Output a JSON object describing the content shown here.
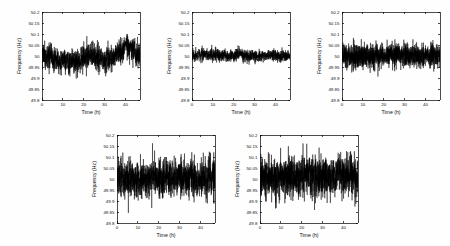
{
  "figure": {
    "background_color": "#ffffff",
    "line_color": "#000000",
    "panel_count": 5,
    "layout": "2 rows: 3 panels on top, 2 panels on bottom"
  },
  "chart_data": [
    {
      "type": "line",
      "panel_index": 1,
      "position": "top-left",
      "title": "",
      "xlabel": "Time (h)",
      "ylabel": "Frequency (Hz)",
      "xlim": [
        0,
        47
      ],
      "ylim": [
        49.8,
        50.2
      ],
      "xticks": [
        0,
        10,
        20,
        30,
        40
      ],
      "xticklabels": [
        "0",
        "10",
        "20",
        "30",
        "40"
      ],
      "yticks": [
        49.8,
        49.85,
        49.9,
        49.95,
        50,
        50.05,
        50.1,
        50.15,
        50.2
      ],
      "yticklabels": [
        "49.8",
        "49.85",
        "49.9",
        "49.95",
        "50",
        "50.05",
        "50.1",
        "50.15",
        "50.2"
      ],
      "grid": false,
      "legend": null,
      "series_name": "Grid frequency trace 1",
      "noise_sigma": 0.028,
      "noise_mean": 50.005,
      "slow_drift_amplitude": 0.022,
      "observed_min": 49.875,
      "observed_max": 50.115,
      "seed": 101,
      "n_points": 1400
    },
    {
      "type": "line",
      "panel_index": 2,
      "position": "top-center",
      "title": "",
      "xlabel": "Time (h)",
      "ylabel": "Frequency (Hz)",
      "xlim": [
        0,
        47
      ],
      "ylim": [
        49.8,
        50.2
      ],
      "xticks": [
        0,
        10,
        20,
        30,
        40
      ],
      "xticklabels": [
        "0",
        "10",
        "20",
        "30",
        "40"
      ],
      "yticks": [
        49.8,
        49.85,
        49.9,
        49.95,
        50,
        50.05,
        50.1,
        50.15,
        50.2
      ],
      "yticklabels": [
        "49.8",
        "49.85",
        "49.9",
        "49.95",
        "50",
        "50.05",
        "50.1",
        "50.15",
        "50.2"
      ],
      "grid": false,
      "legend": null,
      "series_name": "Grid frequency trace 2",
      "noise_sigma": 0.013,
      "noise_mean": 50.001,
      "slow_drift_amplitude": 0.006,
      "observed_min": 49.952,
      "observed_max": 50.062,
      "seed": 202,
      "n_points": 1400
    },
    {
      "type": "line",
      "panel_index": 3,
      "position": "top-right",
      "title": "",
      "xlabel": "Time (h)",
      "ylabel": "Frequency (Hz)",
      "xlim": [
        0,
        47
      ],
      "ylim": [
        49.8,
        50.2
      ],
      "xticks": [
        0,
        10,
        20,
        30,
        40
      ],
      "xticklabels": [
        "0",
        "10",
        "20",
        "30",
        "40"
      ],
      "yticks": [
        49.8,
        49.85,
        49.9,
        49.95,
        50,
        50.05,
        50.1,
        50.15,
        50.2
      ],
      "yticklabels": [
        "49.8",
        "49.85",
        "49.9",
        "49.95",
        "50",
        "50.05",
        "50.1",
        "50.15",
        "50.2"
      ],
      "grid": false,
      "legend": null,
      "series_name": "Grid frequency trace 3",
      "noise_sigma": 0.026,
      "noise_mean": 50.002,
      "slow_drift_amplitude": 0.004,
      "observed_min": 49.905,
      "observed_max": 50.2,
      "seed": 303,
      "n_points": 1700
    },
    {
      "type": "line",
      "panel_index": 4,
      "position": "bottom-left",
      "title": "",
      "xlabel": "Time (h)",
      "ylabel": "Frequency (Hz)",
      "xlim": [
        0,
        47
      ],
      "ylim": [
        49.8,
        50.2
      ],
      "xticks": [
        0,
        10,
        20,
        30,
        40
      ],
      "xticklabels": [
        "0",
        "10",
        "20",
        "30",
        "40"
      ],
      "yticks": [
        49.8,
        49.85,
        49.9,
        49.95,
        50,
        50.05,
        50.1,
        50.15,
        50.2
      ],
      "yticklabels": [
        "49.8",
        "49.85",
        "49.9",
        "49.95",
        "50",
        "50.05",
        "50.1",
        "50.15",
        "50.2"
      ],
      "grid": false,
      "legend": null,
      "series_name": "Grid frequency trace 4",
      "noise_sigma": 0.042,
      "noise_mean": 50.003,
      "slow_drift_amplitude": 0.008,
      "observed_min": 49.845,
      "observed_max": 50.168,
      "seed": 404,
      "n_points": 1500
    },
    {
      "type": "line",
      "panel_index": 5,
      "position": "bottom-center",
      "title": "",
      "xlabel": "Time (h)",
      "ylabel": "Frequency (Hz)",
      "xlim": [
        0,
        47
      ],
      "ylim": [
        49.8,
        50.2
      ],
      "xticks": [
        0,
        10,
        20,
        30,
        40
      ],
      "xticklabels": [
        "0",
        "10",
        "20",
        "30",
        "40"
      ],
      "yticks": [
        49.8,
        49.85,
        49.9,
        49.95,
        50,
        50.05,
        50.1,
        50.15,
        50.2
      ],
      "yticklabels": [
        "49.8",
        "49.85",
        "49.9",
        "49.95",
        "50",
        "50.05",
        "50.1",
        "50.15",
        "50.2"
      ],
      "grid": false,
      "legend": null,
      "series_name": "Grid frequency trace 5",
      "noise_sigma": 0.045,
      "noise_mean": 50.002,
      "slow_drift_amplitude": 0.009,
      "observed_min": 49.822,
      "observed_max": 50.175,
      "seed": 505,
      "n_points": 1500
    }
  ],
  "panel_geometry": [
    {
      "left": 0,
      "top": 0,
      "width": 150,
      "height": 123
    },
    {
      "left": 150,
      "top": 0,
      "width": 150,
      "height": 123
    },
    {
      "left": 300,
      "top": 0,
      "width": 150,
      "height": 123
    },
    {
      "left": 75,
      "top": 123,
      "width": 150,
      "height": 123
    },
    {
      "left": 218,
      "top": 123,
      "width": 150,
      "height": 123
    }
  ]
}
